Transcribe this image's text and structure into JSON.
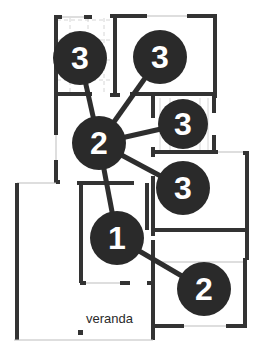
{
  "diagram": {
    "type": "floor-plan-graph",
    "colors": {
      "wall": "#333333",
      "thin_line": "#bdbdbd",
      "tile": "#d6d6d6",
      "node_fill": "#2a2a2a",
      "node_text": "#ffffff",
      "edge": "#2e2e2e",
      "label": "#2a2a2a"
    },
    "nodes": [
      {
        "id": "n_top_left",
        "label": "3",
        "cx": 80,
        "cy": 58,
        "r": 27
      },
      {
        "id": "n_top_right",
        "label": "3",
        "cx": 160,
        "cy": 57,
        "r": 27
      },
      {
        "id": "n_center",
        "label": "2",
        "cx": 99,
        "cy": 143,
        "r": 27
      },
      {
        "id": "n_right_mid",
        "label": "3",
        "cx": 183,
        "cy": 124,
        "r": 25
      },
      {
        "id": "n_right",
        "label": "3",
        "cx": 183,
        "cy": 188,
        "r": 27
      },
      {
        "id": "n_lower",
        "label": "1",
        "cx": 117,
        "cy": 238,
        "r": 27
      },
      {
        "id": "n_bottom_right",
        "label": "2",
        "cx": 204,
        "cy": 289,
        "r": 27
      }
    ],
    "edges": [
      {
        "from": "n_top_left",
        "to": "n_center"
      },
      {
        "from": "n_top_right",
        "to": "n_center"
      },
      {
        "from": "n_center",
        "to": "n_right_mid"
      },
      {
        "from": "n_center",
        "to": "n_right"
      },
      {
        "from": "n_center",
        "to": "n_lower"
      },
      {
        "from": "n_lower",
        "to": "n_bottom_right"
      }
    ],
    "room_labels": [
      {
        "text": "veranda",
        "x": 86,
        "y": 323
      }
    ]
  }
}
